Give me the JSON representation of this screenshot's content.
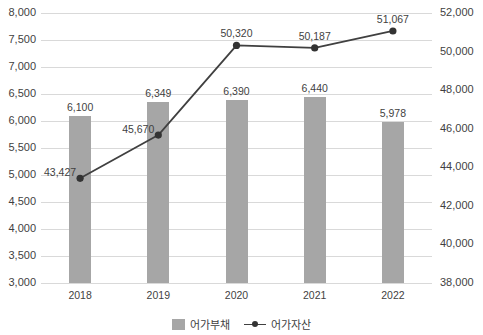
{
  "chart_data": {
    "type": "bar",
    "title": "",
    "subtitle": "",
    "xlabel": "",
    "ylabel": "",
    "categories": [
      "2018",
      "2019",
      "2020",
      "2021",
      "2022"
    ],
    "series": [
      {
        "name": "어가부채",
        "type": "bar",
        "axis": "left",
        "color": "#a6a6a6",
        "values": [
          6100,
          6349,
          6390,
          6440,
          5978
        ],
        "labels": [
          "6,100",
          "6,349",
          "6,390",
          "6,440",
          "5,978"
        ]
      },
      {
        "name": "어가자산",
        "type": "line",
        "axis": "right",
        "color": "#404040",
        "marker": "circle",
        "values": [
          43427,
          45670,
          50320,
          50187,
          51067
        ],
        "labels": [
          "43,427",
          "45,670",
          "50,320",
          "50,187",
          "51,067"
        ]
      }
    ],
    "left_axis": {
      "ylim": [
        3000,
        8000
      ],
      "tick_step": 500,
      "ticks": [
        "3,000",
        "3,500",
        "4,000",
        "4,500",
        "5,000",
        "5,500",
        "6,000",
        "6,500",
        "7,000",
        "7,500",
        "8,000"
      ]
    },
    "right_axis": {
      "ylim": [
        38000,
        52000
      ],
      "tick_step": 2000,
      "ticks": [
        "38,000",
        "40,000",
        "42,000",
        "44,000",
        "46,000",
        "48,000",
        "50,000",
        "52,000"
      ]
    },
    "grid": true,
    "legend_position": "bottom",
    "legend": [
      "어가부채",
      "어가자산"
    ]
  }
}
